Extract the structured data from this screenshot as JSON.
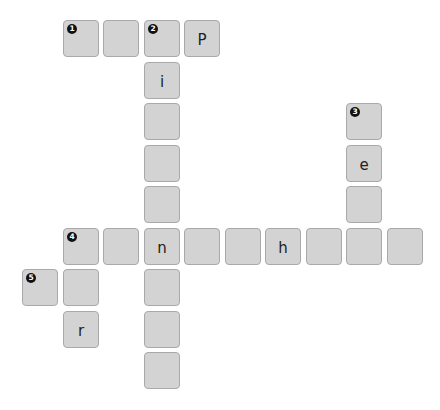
{
  "header": {
    "clipped_text": ""
  },
  "puzzle": {
    "type": "crossword",
    "grid": {
      "origin_x": 22,
      "origin_y": 20,
      "pitch_x": 40.5,
      "pitch_y": 41.5
    },
    "cells": [
      {
        "row": 0,
        "col": 1,
        "letter": "",
        "number": "1"
      },
      {
        "row": 0,
        "col": 2,
        "letter": "",
        "number": ""
      },
      {
        "row": 0,
        "col": 3,
        "letter": "",
        "number": "2"
      },
      {
        "row": 0,
        "col": 4,
        "letter": "P",
        "number": ""
      },
      {
        "row": 1,
        "col": 3,
        "letter": "i",
        "number": ""
      },
      {
        "row": 2,
        "col": 3,
        "letter": "",
        "number": ""
      },
      {
        "row": 2,
        "col": 8,
        "letter": "",
        "number": "3"
      },
      {
        "row": 3,
        "col": 3,
        "letter": "",
        "number": ""
      },
      {
        "row": 3,
        "col": 8,
        "letter": "e",
        "number": ""
      },
      {
        "row": 4,
        "col": 3,
        "letter": "",
        "number": ""
      },
      {
        "row": 4,
        "col": 8,
        "letter": "",
        "number": ""
      },
      {
        "row": 5,
        "col": 1,
        "letter": "",
        "number": "4"
      },
      {
        "row": 5,
        "col": 2,
        "letter": "",
        "number": ""
      },
      {
        "row": 5,
        "col": 3,
        "letter": "n",
        "number": ""
      },
      {
        "row": 5,
        "col": 4,
        "letter": "",
        "number": ""
      },
      {
        "row": 5,
        "col": 5,
        "letter": "",
        "number": ""
      },
      {
        "row": 5,
        "col": 6,
        "letter": "h",
        "number": ""
      },
      {
        "row": 5,
        "col": 7,
        "letter": "",
        "number": ""
      },
      {
        "row": 5,
        "col": 8,
        "letter": "",
        "number": ""
      },
      {
        "row": 5,
        "col": 9,
        "letter": "",
        "number": ""
      },
      {
        "row": 6,
        "col": 0,
        "letter": "",
        "number": "5"
      },
      {
        "row": 6,
        "col": 1,
        "letter": "",
        "number": ""
      },
      {
        "row": 6,
        "col": 3,
        "letter": "",
        "number": ""
      },
      {
        "row": 7,
        "col": 1,
        "letter": "r",
        "number": ""
      },
      {
        "row": 7,
        "col": 3,
        "letter": "",
        "number": ""
      },
      {
        "row": 8,
        "col": 3,
        "letter": "",
        "number": ""
      }
    ],
    "colors": {
      "tile_fill": "#d3d3d3",
      "tile_border": "#a9a9a9",
      "badge": "#111111",
      "text": "#222222"
    }
  }
}
